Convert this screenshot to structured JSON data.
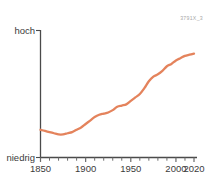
{
  "watermark": {
    "text": "3791X_3"
  },
  "colors": {
    "line": "#E4835C",
    "axis": "#4a4a4a",
    "tick": "#6b6b6b",
    "text": "#3b3b3b",
    "watermark": "#a8a8a8",
    "background": "#ffffff"
  },
  "chart_data": {
    "type": "line",
    "title": "",
    "subtitle": "",
    "xlabel": "",
    "ylabel": "",
    "grid": false,
    "legend": null,
    "xlim": [
      1850,
      2020
    ],
    "ylim": [
      0,
      100
    ],
    "y_axis_labels": {
      "top": "hoch",
      "bottom": "niedrig"
    },
    "x_tick_labels": [
      "1850",
      "1900",
      "1950",
      "2000",
      "2020"
    ],
    "x_tick_values": [
      1850,
      1900,
      1950,
      2000,
      2020
    ],
    "x_minor_tick_step": 10,
    "series": [
      {
        "name": "Trend",
        "color": "#E4835C",
        "x": [
          1850,
          1855,
          1860,
          1865,
          1870,
          1875,
          1880,
          1885,
          1890,
          1895,
          1900,
          1905,
          1910,
          1915,
          1920,
          1925,
          1930,
          1935,
          1940,
          1945,
          1950,
          1955,
          1960,
          1965,
          1970,
          1975,
          1980,
          1985,
          1990,
          1995,
          2000,
          2005,
          2010,
          2015,
          2020
        ],
        "y": [
          24,
          23,
          22,
          21,
          20,
          20,
          21,
          22,
          24,
          26,
          29,
          32,
          35,
          37,
          38,
          39,
          41,
          44,
          45,
          46,
          49,
          52,
          55,
          60,
          66,
          70,
          72,
          75,
          79,
          81,
          84,
          86,
          88,
          89,
          90
        ]
      }
    ]
  }
}
